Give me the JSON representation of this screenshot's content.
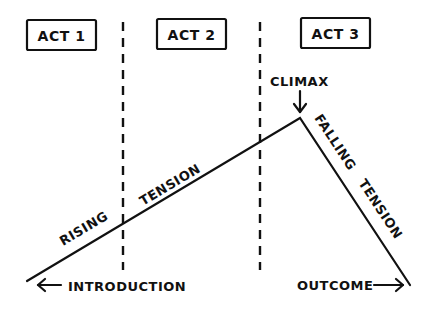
{
  "acts": [
    {
      "label": "ACT 1"
    },
    {
      "label": "ACT 2"
    },
    {
      "label": "ACT 3"
    }
  ],
  "curve": {
    "rising_label_1": "RISING",
    "rising_label_2": "TENSION",
    "climax_label": "CLIMAX",
    "falling_label_1": "FALLING",
    "falling_label_2": "TENSION"
  },
  "footer": {
    "left_label": "INTRODUCTION",
    "right_label": "OUTCOME"
  },
  "colors": {
    "ink": "#111111",
    "background": "#ffffff"
  }
}
